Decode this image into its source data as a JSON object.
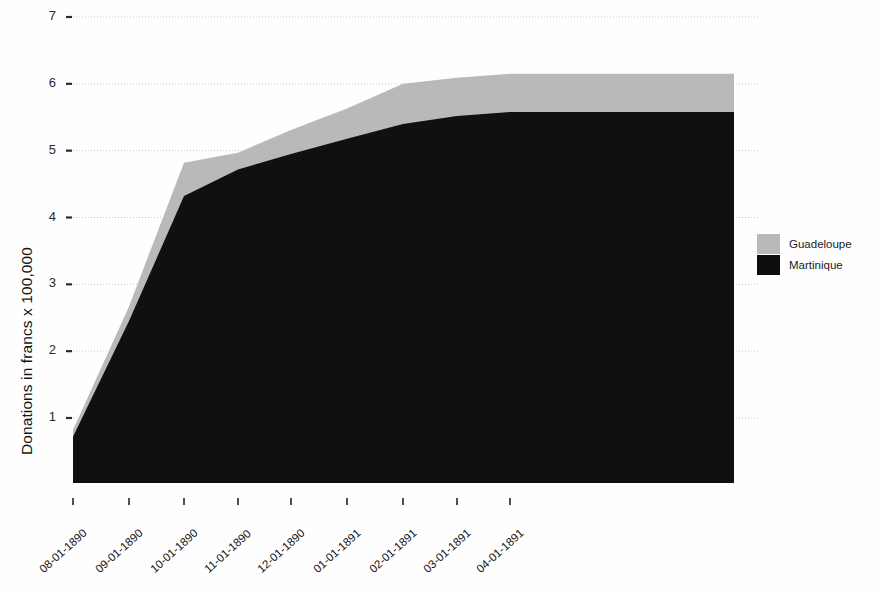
{
  "chart_data": {
    "type": "area",
    "stacked": true,
    "title": "",
    "subtitle": "",
    "xlabel": "",
    "ylabel": "Donations in francs x 100,000",
    "ylim": [
      0,
      7
    ],
    "yticks": [
      1,
      2,
      3,
      4,
      5,
      6,
      7
    ],
    "ytick_labels": [
      "1",
      "2",
      "3",
      "4",
      "5",
      "6",
      "7"
    ],
    "grid": true,
    "grid_style": "dotted-horizontal",
    "legend_position": "right",
    "categories": [
      "08-01-1890",
      "09-01-1890",
      "10-01-1890",
      "11-01-1890",
      "12-01-1890",
      "01-01-1891",
      "02-01-1891",
      "03-01-1891",
      "04-01-1891"
    ],
    "x": [
      "08-01-1890",
      "09-01-1890",
      "10-01-1890",
      "11-01-1890",
      "12-01-1890",
      "01-01-1891",
      "02-01-1891",
      "03-01-1891",
      "04-01-1891"
    ],
    "series": [
      {
        "name": "Martinique",
        "color": "#101010",
        "values": [
          0.72,
          2.45,
          4.32,
          4.72,
          4.95,
          5.18,
          5.4,
          5.52,
          5.58
        ]
      },
      {
        "name": "Guadeloupe",
        "color": "#b9b9b9",
        "values": [
          0.1,
          0.22,
          0.5,
          0.25,
          0.36,
          0.45,
          0.6,
          0.57,
          0.57
        ]
      }
    ],
    "series_totals": {
      "name": "Total (stacked top)",
      "values": [
        0.82,
        2.67,
        4.82,
        4.97,
        5.31,
        5.63,
        6.0,
        6.09,
        6.15
      ]
    },
    "legend": [
      "Guadeloupe",
      "Martinique"
    ]
  },
  "axes": {
    "y_label": "Donations in francs x 100,000",
    "y_ticks": [
      "7",
      "6",
      "5",
      "4",
      "3",
      "2",
      "1"
    ],
    "x_ticks": [
      "08-01-1890",
      "09-01-1890",
      "10-01-1890",
      "11-01-1890",
      "12-01-1890",
      "01-01-1891",
      "02-01-1891",
      "03-01-1891",
      "04-01-1891"
    ]
  },
  "legend": {
    "items": [
      {
        "label": "Guadeloupe",
        "color": "#b9b9b9"
      },
      {
        "label": "Martinique",
        "color": "#0d0d0d"
      }
    ]
  },
  "colors": {
    "guadeloupe": "#b9b9b9",
    "martinique": "#101010",
    "grid": "#c9c9c9",
    "text": "#1a1a1a",
    "background": "#ffffff"
  }
}
